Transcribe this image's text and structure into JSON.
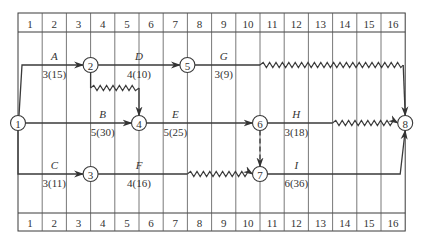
{
  "diagram": {
    "type": "time-scaled network (double-code) diagram",
    "grid": {
      "columns": 16,
      "top_labels": [
        "1",
        "2",
        "3",
        "4",
        "5",
        "6",
        "7",
        "8",
        "9",
        "10",
        "11",
        "12",
        "13",
        "14",
        "15",
        "16"
      ],
      "bottom_labels": [
        "1",
        "2",
        "3",
        "4",
        "5",
        "6",
        "7",
        "8",
        "9",
        "10",
        "11",
        "12",
        "13",
        "14",
        "15",
        "16"
      ],
      "x_start": 18,
      "col_width": 24.2,
      "top_row": [
        13,
        32
      ],
      "bottom_row": [
        213,
        231
      ]
    },
    "nodes": [
      {
        "id": "1",
        "label": "1",
        "col": 0,
        "y": 123
      },
      {
        "id": "2",
        "label": "2",
        "col": 3,
        "y": 65
      },
      {
        "id": "3",
        "label": "3",
        "col": 3,
        "y": 174
      },
      {
        "id": "4",
        "label": "4",
        "col": 5,
        "y": 123
      },
      {
        "id": "5",
        "label": "5",
        "col": 7,
        "y": 65
      },
      {
        "id": "6",
        "label": "6",
        "col": 10,
        "y": 123
      },
      {
        "id": "7",
        "label": "7",
        "col": 10,
        "y": 174
      },
      {
        "id": "8",
        "label": "8",
        "col": 16,
        "y": 123
      }
    ],
    "activities": [
      {
        "name": "A",
        "value": "3(15)",
        "from": "1",
        "to": "2"
      },
      {
        "name": "B",
        "value": "5(30)",
        "from": "1",
        "to": "4"
      },
      {
        "name": "C",
        "value": "3(11)",
        "from": "1",
        "to": "3"
      },
      {
        "name": "D",
        "value": "4(10)",
        "from": "2",
        "to": "5"
      },
      {
        "name": "E",
        "value": "5(25)",
        "from": "4",
        "to": "6"
      },
      {
        "name": "F",
        "value": "4(16)",
        "from": "3",
        "to": "7"
      },
      {
        "name": "G",
        "value": "3(9)",
        "from": "5",
        "to": "8"
      },
      {
        "name": "H",
        "value": "3(18)",
        "from": "6",
        "to": "8"
      },
      {
        "name": "I",
        "value": "6(36)",
        "from": "7",
        "to": "8"
      }
    ],
    "float_lines": [
      {
        "from": "2",
        "to": "4",
        "cols": [
          3,
          5
        ]
      },
      {
        "from": "5",
        "to": "8",
        "cols": [
          10,
          16
        ]
      },
      {
        "from": "6",
        "to": "8",
        "cols": [
          13,
          16
        ]
      },
      {
        "from": "3",
        "to": "7",
        "cols": [
          7,
          10
        ]
      }
    ],
    "dummy_activities": [
      {
        "from": "6",
        "to": "7",
        "style": "dashed"
      }
    ]
  }
}
